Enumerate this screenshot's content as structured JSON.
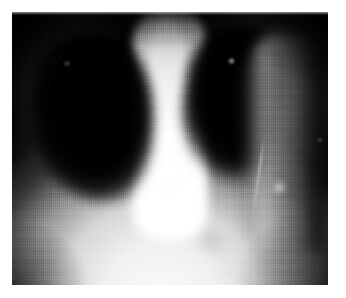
{
  "document": {
    "type": "medical-image",
    "modality": "X-ray radiograph",
    "body_region": "Chest",
    "projection": "Frontal (AP/PA)",
    "color_mode": "Grayscale",
    "caption": ""
  },
  "canvas": {
    "width_px": 346,
    "height_px": 298,
    "background_color": "#ffffff",
    "margin_px": 12
  },
  "plate": {
    "x_px": 12,
    "y_px": 12,
    "width_px": 316,
    "height_px": 273,
    "base_color": "#030303",
    "highlight_color": "#ffffff",
    "midtone_color": "#8a8a8a"
  },
  "regions": [
    {
      "id": "lung-left",
      "label": "Right lung field (image left)",
      "tone": "radiolucent / dark"
    },
    {
      "id": "lung-right",
      "label": "Left lung field (image right)",
      "tone": "radiolucent / dark"
    },
    {
      "id": "mediastinum",
      "label": "Mediastinum and spine column",
      "tone": "radiopaque / bright"
    },
    {
      "id": "torso",
      "label": "Diaphragm and upper abdomen",
      "tone": "radiopaque / bright"
    },
    {
      "id": "chestwall-right",
      "label": "Lateral chest wall",
      "tone": "mid gray"
    },
    {
      "id": "apex-band",
      "label": "Lung apices / neck base",
      "tone": "dark gray"
    }
  ],
  "findings": [
    {
      "id": "marker-right-lung",
      "label": "Bright speck, left upper zone"
    },
    {
      "id": "marker-left-lung",
      "label": "Faint density, right upper zone"
    },
    {
      "id": "opacity-lower",
      "label": "Nodular opacity, left cardiophrenic angle"
    },
    {
      "id": "opacity-basal",
      "label": "Faint rounded basal density"
    },
    {
      "id": "line-catheter",
      "label": "Thin linear opacity descending laterally"
    },
    {
      "id": "marker-edge-right",
      "label": "Small marker at right image border"
    }
  ],
  "artifacts": {
    "scanline_texture": "vertical raster lines",
    "block_mottle": "compression blocking"
  }
}
